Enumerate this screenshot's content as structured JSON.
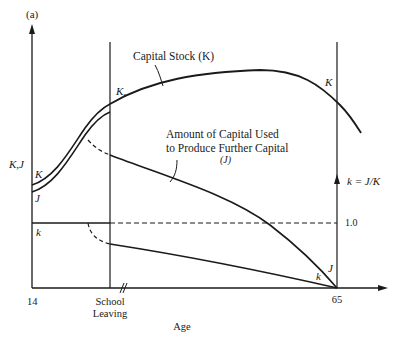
{
  "figure": {
    "panel_label": "(a)",
    "y_axis_label": "K,J",
    "x_axis_label": "Age",
    "x_ticks": {
      "start": "14",
      "school_leaving_line1": "School",
      "school_leaving_line2": "Leaving",
      "end": "65"
    },
    "right_axis_label": "k = J/K",
    "right_axis_tick": "1.0",
    "annotations": {
      "capital_stock": "Capital Stock (K)",
      "capital_used_line1": "Amount of Capital Used",
      "capital_used_line2": "to Produce Further Capital",
      "capital_used_line3": "(J)",
      "ks": "K",
      "ks_sub": "s",
      "curve_K_left": "K",
      "curve_J_left": "J",
      "curve_k_left": "k",
      "curve_K_right": "K",
      "curve_J_right": "J",
      "curve_k_right": "k"
    },
    "colors": {
      "ink": "#1a1a1a",
      "background": "#ffffff"
    }
  }
}
